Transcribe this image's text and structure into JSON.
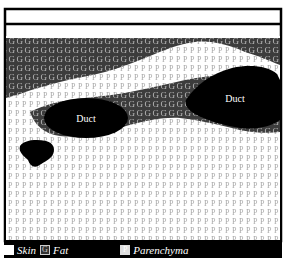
{
  "diagram": {
    "type": "tissue-cross-section",
    "regions": [
      {
        "id": "skin",
        "label": "Skin",
        "fill": "#ffffff"
      },
      {
        "id": "fat",
        "label": "Fat",
        "letter": "G",
        "fill": "#3c3c3c",
        "letter_color": "#b8b8b8"
      },
      {
        "id": "parenchyma",
        "label": "Parenchyma",
        "letter": "P",
        "fill": "#ffffff",
        "letter_color": "#a8a8a8"
      },
      {
        "id": "duct",
        "label": "Duct",
        "fill": "#000000"
      }
    ],
    "duct_labels": [
      "Duct",
      "Duct"
    ]
  },
  "legend": {
    "items": [
      {
        "label": "Skin",
        "glyph": ""
      },
      {
        "label": "Fat",
        "glyph": "G"
      },
      {
        "label": "Parenchyma",
        "glyph": "P"
      }
    ]
  }
}
